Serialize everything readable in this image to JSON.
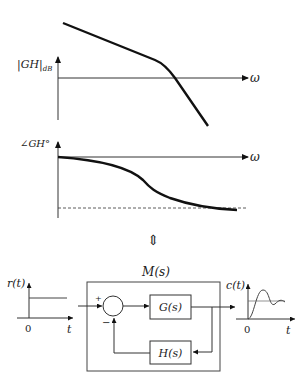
{
  "magnitude_plot": {
    "ylabel": "|GH|",
    "ylabel_sub": "dB",
    "xlabel": "ω"
  },
  "phase_plot": {
    "ylabel": "∠GH°",
    "xlabel": "ω"
  },
  "equivalence_symbol": "⇕",
  "block_diagram": {
    "system_label": "M(s)",
    "forward_block": "G(s)",
    "feedback_block": "H(s)",
    "summer_plus": "+",
    "summer_minus": "−",
    "input_plot": {
      "ylabel": "r(t)",
      "xlabel": "t",
      "origin": "0"
    },
    "output_plot": {
      "ylabel": "c(t)",
      "xlabel": "t",
      "origin": "0"
    }
  },
  "colors": {
    "stroke": "#111111",
    "axis": "#333333"
  }
}
